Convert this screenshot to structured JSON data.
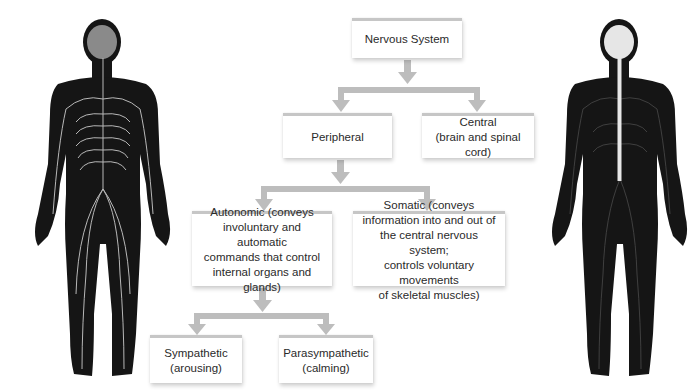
{
  "diagram": {
    "root": {
      "label": "Nervous System"
    },
    "level1": [
      {
        "label": "Peripheral",
        "sub": ""
      },
      {
        "label": "Central",
        "sub": "(brain and spinal cord)"
      }
    ],
    "level2": [
      {
        "lines": [
          "Autonomic (conveys",
          "involuntary and automatic",
          "commands that control",
          "internal organs and glands)"
        ]
      },
      {
        "lines": [
          "Somatic (conveys",
          "information into and out of",
          "the central nervous system;",
          "controls voluntary movements",
          "of skeletal muscles)"
        ]
      }
    ],
    "level3": [
      {
        "label": "Sympathetic",
        "sub": "(arousing)"
      },
      {
        "label": "Parasympathetic",
        "sub": "(calming)"
      }
    ]
  },
  "figures": {
    "left": {
      "description": "human-figure-peripheral-nervous-system",
      "body_color": "#151515",
      "brain_color": "#8a8a8a",
      "nerve_color": "#b8b8b8"
    },
    "right": {
      "description": "human-figure-central-nervous-system",
      "body_color": "#151515",
      "brain_color": "#e6e6e6",
      "nerve_color": "#6a6a6a"
    }
  },
  "colors": {
    "connector": "#bdbdbd",
    "box_border": "#c6c6c6",
    "text": "#2a2a2a"
  }
}
